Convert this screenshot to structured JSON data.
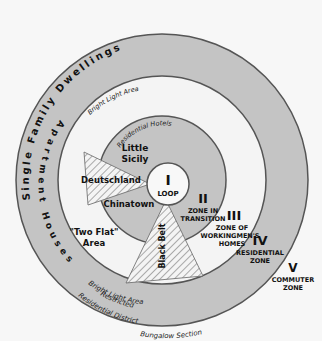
{
  "diagram": {
    "colors": {
      "background": "#f7f7f7",
      "ring_gray": "#c4c4c4",
      "ring_white": "#f4f4f4",
      "stroke": "#555555",
      "text": "#111111"
    },
    "zones": [
      {
        "numeral": "I",
        "name": "LOOP"
      },
      {
        "numeral": "II",
        "name_line1": "ZONE IN",
        "name_line2": "TRANSITION"
      },
      {
        "numeral": "III",
        "name_line1": "ZONE OF",
        "name_line2": "WORKINGMEN'S",
        "name_line3": "HOMES"
      },
      {
        "numeral": "IV",
        "name_line1": "RESIDENTIAL",
        "name_line2": "ZONE"
      },
      {
        "numeral": "V",
        "name_line1": "COMMUTER",
        "name_line2": "ZONE"
      }
    ],
    "neighborhoods": {
      "little_sicily_1": "Little",
      "little_sicily_2": "Sicily",
      "deutschland": "Deutschland",
      "chinatown": "Chinatown",
      "black_belt": "Black Belt",
      "two_flat_1": "\"Two Flat\"",
      "two_flat_2": "Area"
    },
    "arc_labels": {
      "residential_hotels": "Residential Hotels",
      "single_family": "Single Family Dwellings",
      "apartment_houses": "Apartment Houses",
      "bright_light_top": "Bright Light Area",
      "bright_light_bottom": "Bright Light Area",
      "restricted": "Restricted",
      "residential_district": "Residential District",
      "bungalow_section": "Bungalow Section"
    }
  }
}
